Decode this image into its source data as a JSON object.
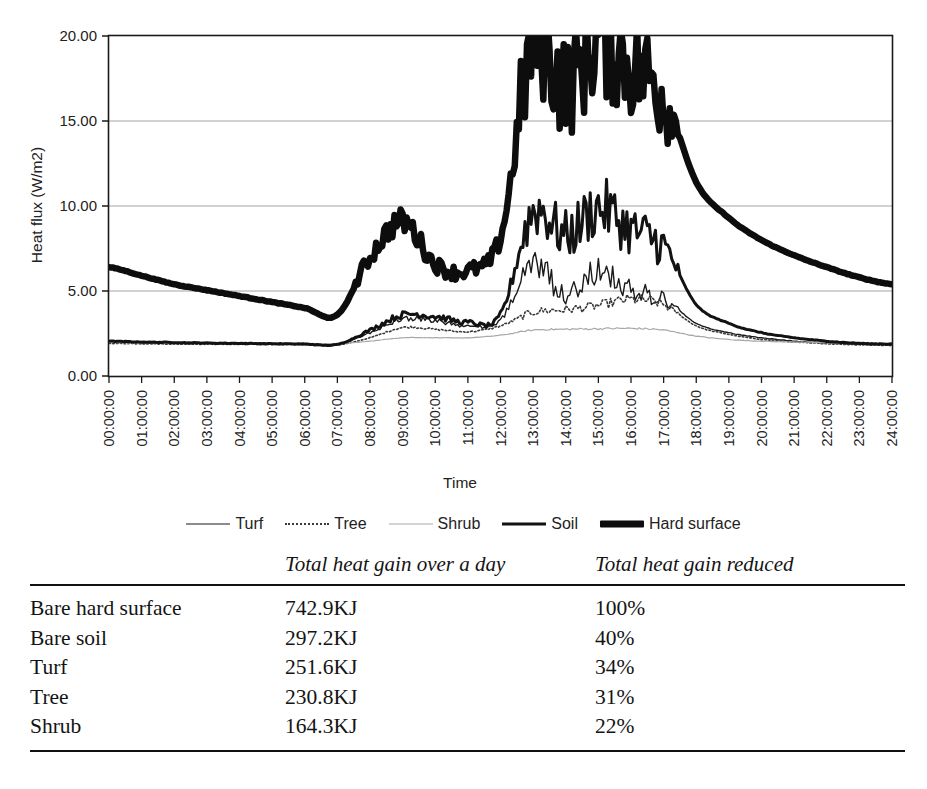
{
  "figure": {
    "background": "#ffffff",
    "ink": "#1a1a1a"
  },
  "chart_data": {
    "type": "line",
    "title": "",
    "xlabel": "Time",
    "ylabel": "Heat flux (W/m2)",
    "ylim": [
      0,
      20
    ],
    "yticks": [
      "0.00",
      "5.00",
      "10.00",
      "15.00",
      "20.00"
    ],
    "ytick_values": [
      0,
      5,
      10,
      15,
      20
    ],
    "grid": "horizontal",
    "legend_position": "below-axis",
    "x": [
      "00:00:00",
      "01:00:00",
      "02:00:00",
      "03:00:00",
      "04:00:00",
      "05:00:00",
      "06:00:00",
      "07:00:00",
      "08:00:00",
      "09:00:00",
      "10:00:00",
      "11:00:00",
      "12:00:00",
      "13:00:00",
      "14:00:00",
      "15:00:00",
      "16:00:00",
      "17:00:00",
      "18:00:00",
      "19:00:00",
      "20:00:00",
      "21:00:00",
      "22:00:00",
      "23:00:00",
      "24:00:00"
    ],
    "series": [
      {
        "name": "Turf",
        "style": "thin-solid",
        "color": "#1a1a1a",
        "width": 1.4,
        "values": [
          2.0,
          1.97,
          1.95,
          1.93,
          1.92,
          1.9,
          1.88,
          1.86,
          2.55,
          3.35,
          3.25,
          2.95,
          3.3,
          6.5,
          4.8,
          6.2,
          5.0,
          4.55,
          3.1,
          2.55,
          2.25,
          2.05,
          1.95,
          1.88,
          1.85
        ]
      },
      {
        "name": "Tree",
        "style": "dotted",
        "color": "#3a3a3a",
        "width": 1.6,
        "values": [
          1.92,
          1.9,
          1.88,
          1.87,
          1.86,
          1.85,
          1.84,
          1.82,
          2.25,
          2.85,
          2.75,
          2.6,
          2.95,
          3.75,
          3.9,
          4.15,
          4.5,
          4.2,
          2.95,
          2.45,
          2.15,
          2.0,
          1.9,
          1.84,
          1.8
        ]
      },
      {
        "name": "Shrub",
        "style": "thin-light",
        "color": "#a8a8a8",
        "width": 1.2,
        "values": [
          1.98,
          1.96,
          1.95,
          1.94,
          1.93,
          1.92,
          1.91,
          1.9,
          2.05,
          2.25,
          2.25,
          2.25,
          2.4,
          2.7,
          2.75,
          2.78,
          2.8,
          2.7,
          2.35,
          2.15,
          2.05,
          2.0,
          1.96,
          1.94,
          1.92
        ]
      },
      {
        "name": "Soil",
        "style": "medium-solid",
        "color": "#121212",
        "width": 3.0,
        "values": [
          2.05,
          2.0,
          1.97,
          1.94,
          1.92,
          1.9,
          1.88,
          1.86,
          2.7,
          3.6,
          3.5,
          3.15,
          3.6,
          9.7,
          8.3,
          9.9,
          8.6,
          7.6,
          4.2,
          3.1,
          2.55,
          2.25,
          2.05,
          1.92,
          1.88
        ]
      },
      {
        "name": "Hard surface",
        "style": "heavy-solid",
        "color": "#0d0d0d",
        "width": 6.5,
        "values": [
          6.4,
          5.9,
          5.4,
          5.05,
          4.7,
          4.35,
          4.0,
          3.6,
          7.0,
          9.1,
          6.6,
          6.2,
          8.2,
          19.5,
          17.1,
          19.7,
          18.3,
          16.6,
          11.4,
          9.3,
          8.0,
          7.1,
          6.4,
          5.8,
          5.4
        ]
      }
    ]
  },
  "legend": {
    "items": [
      {
        "label": "Turf",
        "swatch": "legend-line-turf"
      },
      {
        "label": "Tree",
        "swatch": "legend-line-tree"
      },
      {
        "label": "Shrub",
        "swatch": "legend-line-shrub"
      },
      {
        "label": "Soil",
        "swatch": "legend-line-soil"
      },
      {
        "label": "Hard surface",
        "swatch": "legend-line-hard-surface"
      }
    ]
  },
  "table": {
    "headers": [
      "",
      "Total heat gain over a day",
      "Total heat gain reduced"
    ],
    "rows": [
      {
        "name": "Bare hard surface",
        "total": "742.9KJ",
        "reduced": "100%"
      },
      {
        "name": "Bare soil",
        "total": "297.2KJ",
        "reduced": "40%"
      },
      {
        "name": "Turf",
        "total": "251.6KJ",
        "reduced": "34%"
      },
      {
        "name": "Tree",
        "total": "230.8KJ",
        "reduced": "31%"
      },
      {
        "name": "Shrub",
        "total": "164.3KJ",
        "reduced": "22%"
      }
    ]
  }
}
